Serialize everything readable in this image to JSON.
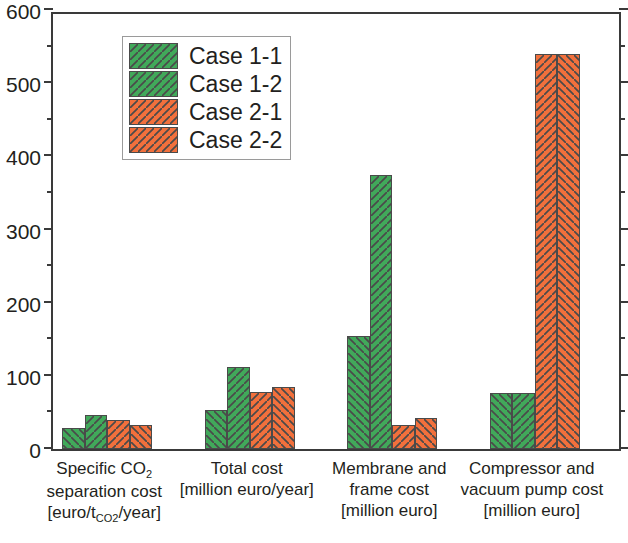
{
  "chart_data": {
    "type": "bar",
    "title": "",
    "xlabel": "",
    "ylabel": "",
    "ylim": [
      0,
      600
    ],
    "y_ticks_major": [
      0,
      100,
      200,
      300,
      400,
      500,
      600
    ],
    "y_ticks_minor": [
      50,
      150,
      250,
      350,
      450,
      550
    ],
    "grid": false,
    "legend_position": "upper-left-inside",
    "categories": [
      "Specific CO2 separation cost [euro/tCO2/year]",
      "Total cost [million euro/year]",
      "Membrane and frame cost [million euro]",
      "Compressor and vacuum pump cost [million euro]"
    ],
    "series": [
      {
        "name": "Case 1-1",
        "color": "#41a95a",
        "hatch": "back",
        "values": [
          29,
          53,
          155,
          76
        ]
      },
      {
        "name": "Case 1-2",
        "color": "#41a95a",
        "hatch": "fwd",
        "values": [
          47,
          112,
          375,
          76
        ]
      },
      {
        "name": "Case 2-1",
        "color": "#f2703c",
        "hatch": "fwd",
        "values": [
          40,
          78,
          33,
          540
        ]
      },
      {
        "name": "Case 2-2",
        "color": "#f2703c",
        "hatch": "back",
        "values": [
          33,
          85,
          42,
          540
        ]
      }
    ]
  },
  "axis": {
    "y_tick_labels": [
      "0",
      "100",
      "200",
      "300",
      "400",
      "500",
      "600"
    ]
  },
  "legend": {
    "entries": [
      {
        "label": "Case 1-1"
      },
      {
        "label": "Case 1-2"
      },
      {
        "label": "Case 2-1"
      },
      {
        "label": "Case 2-2"
      }
    ]
  },
  "x_axis_labels": [
    {
      "line1": "Specific CO",
      "line1_sub": "2",
      "line2": "separation cost",
      "line3_pre": "[euro/t",
      "line3_sub": "CO2",
      "line3_post": "/year]"
    },
    {
      "line1": "Total cost",
      "line2": "[million euro/year]",
      "line3": ""
    },
    {
      "line1": "Membrane and",
      "line2": "frame cost",
      "line3": "[million euro]"
    },
    {
      "line1": "Compressor and",
      "line2": "vacuum pump cost",
      "line3": "[million euro]"
    }
  ],
  "colors": {
    "green": "#41a95a",
    "orange": "#f2703c",
    "axis": "#3a3a3a",
    "text": "#231f20"
  }
}
